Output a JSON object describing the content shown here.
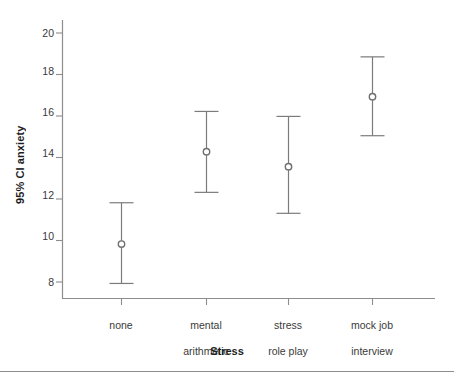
{
  "chart_data": {
    "type": "scatter",
    "title": "",
    "xlabel": "Stress",
    "ylabel": "95% CI anxiety",
    "categories": [
      "none",
      "mental arithmetic",
      "stress role play",
      "mock job interview"
    ],
    "category_label_lines": [
      [
        "none"
      ],
      [
        "mental",
        "arithmetic"
      ],
      [
        "stress",
        "role play"
      ],
      [
        "mock job",
        "interview"
      ]
    ],
    "values": [
      9.83,
      14.28,
      13.56,
      16.93
    ],
    "ci_lower": [
      7.93,
      12.32,
      11.31,
      15.05
    ],
    "ci_upper": [
      11.82,
      16.22,
      15.98,
      18.85
    ],
    "series": [
      {
        "name": "95% CI anxiety",
        "points": [
          {
            "category": "none",
            "mean": 9.83,
            "lower": 7.93,
            "upper": 11.82
          },
          {
            "category": "mental arithmetic",
            "mean": 14.28,
            "lower": 12.32,
            "upper": 16.22
          },
          {
            "category": "stress role play",
            "mean": 13.56,
            "lower": 11.31,
            "upper": 15.98
          },
          {
            "category": "mock job interview",
            "mean": 16.93,
            "lower": 15.05,
            "upper": 18.85
          }
        ]
      }
    ],
    "yticks": [
      8,
      10,
      12,
      14,
      16,
      18,
      20
    ],
    "ytick_labels": [
      "8",
      "10",
      "12",
      "14",
      "16",
      "18",
      "20"
    ],
    "ylim": [
      7.0,
      20.8
    ],
    "grid": false,
    "legend": "none",
    "marker": "open-circle",
    "error_bar_style": "capped",
    "colors": {
      "axis": "#8d8d8d",
      "error_bar": "#7b7b7b",
      "marker_stroke": "#6f6f6f",
      "marker_fill": "#ffffff",
      "text": "#2b2b2b",
      "background": "#ffffff"
    }
  }
}
